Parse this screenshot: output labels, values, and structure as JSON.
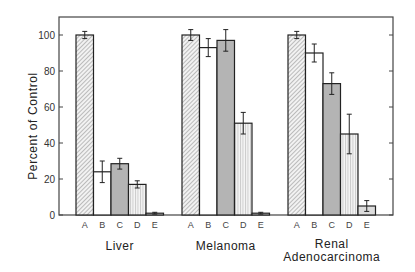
{
  "chart_data": {
    "type": "bar",
    "title": "",
    "xlabel": "",
    "ylabel": "Percent of Control",
    "ylim": [
      0,
      110
    ],
    "yticks": [
      0,
      20,
      40,
      60,
      80,
      100
    ],
    "grid": false,
    "legend": null,
    "bar_categories": [
      "A",
      "B",
      "C",
      "D",
      "E"
    ],
    "groups": [
      {
        "name": "Liver",
        "label_lines": [
          "Liver"
        ],
        "values": [
          100,
          24,
          28.5,
          17,
          1
        ],
        "errors": [
          2,
          6,
          3,
          2,
          0.5
        ]
      },
      {
        "name": "Melanoma",
        "label_lines": [
          "Melanoma"
        ],
        "values": [
          100,
          93,
          97,
          51,
          1
        ],
        "errors": [
          3,
          5,
          6,
          6,
          0.5
        ]
      },
      {
        "name": "Renal Adenocarcinoma",
        "label_lines": [
          "Renal",
          "Adenocarcinoma"
        ],
        "values": [
          100,
          90,
          73,
          45,
          5
        ],
        "errors": [
          2,
          5,
          6,
          11,
          3
        ]
      }
    ],
    "bar_styles": {
      "A": {
        "fill": "diagonal-hatch",
        "color": "#e8e8e8"
      },
      "B": {
        "fill": "white",
        "color": "#ffffff"
      },
      "C": {
        "fill": "solid-gray",
        "color": "#b8b8b8"
      },
      "D": {
        "fill": "vertical-lines",
        "color": "#eeeeee"
      },
      "E": {
        "fill": "light",
        "color": "#e0e0e0"
      }
    }
  }
}
